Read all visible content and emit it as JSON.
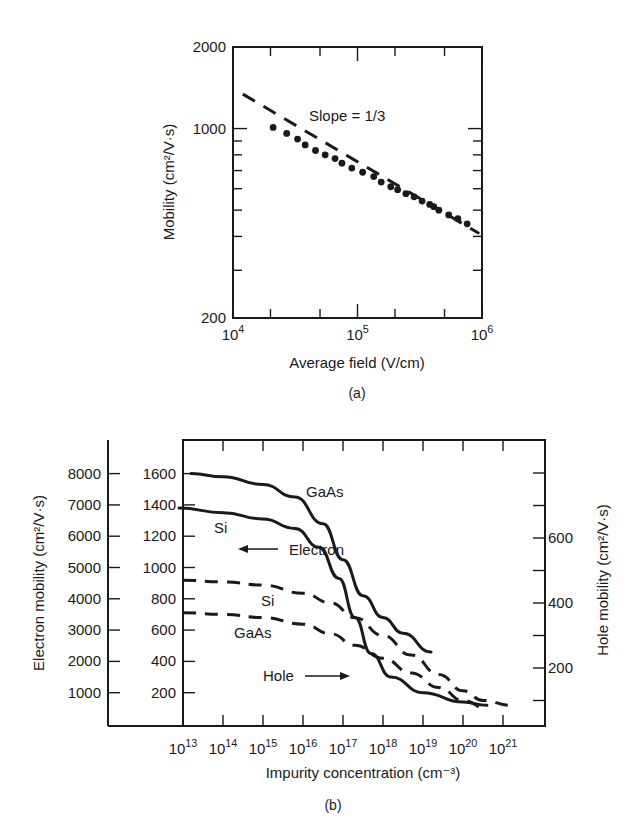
{
  "figure": {
    "panel_a_caption": "(a)",
    "panel_b_caption": "(b)"
  },
  "chart_data": [
    {
      "type": "scatter",
      "panel": "(a)",
      "title": "",
      "xlabel": "Average field (V/cm)",
      "ylabel": "Mobility (cm²/V·s)",
      "xscale": "log",
      "yscale": "log",
      "xlim": [
        10000,
        1000000
      ],
      "ylim": [
        200,
        2000
      ],
      "x_ticks": [
        {
          "value": 10000,
          "base": "10",
          "exp": "4"
        },
        {
          "value": 100000,
          "base": "10",
          "exp": "5"
        },
        {
          "value": 1000000,
          "base": "10",
          "exp": "6"
        }
      ],
      "y_ticks": [
        "200",
        "1000",
        "2000"
      ],
      "annotation": "Slope = 1/3",
      "grid": false,
      "series": [
        {
          "name": "Measured",
          "style": "dots",
          "x": [
            21000,
            27000,
            33000,
            38000,
            46000,
            55000,
            66000,
            75000,
            90000,
            110000,
            135000,
            155000,
            185000,
            210000,
            245000,
            285000,
            330000,
            380000,
            410000,
            450000,
            540000,
            640000,
            760000
          ],
          "y": [
            1010,
            960,
            915,
            870,
            830,
            800,
            775,
            745,
            715,
            690,
            665,
            635,
            610,
            595,
            575,
            560,
            540,
            525,
            515,
            500,
            480,
            465,
            445
          ]
        },
        {
          "name": "Slope = 1/3 fit",
          "style": "dashed",
          "x": [
            12000,
            950000
          ],
          "y": [
            1340,
            410
          ]
        }
      ]
    },
    {
      "type": "line",
      "panel": "(b)",
      "title": "",
      "xlabel": "Impurity concentration (cm⁻³)",
      "ylabel_left_outer": "Electron mobility (cm²/V·s)",
      "ylabel_right": "Hole mobility (cm²/V·s)",
      "xscale": "log",
      "xlim": [
        10000000000000.0,
        1e+21
      ],
      "x_ticks": [
        {
          "base": "10",
          "exp": "13"
        },
        {
          "base": "10",
          "exp": "14"
        },
        {
          "base": "10",
          "exp": "15"
        },
        {
          "base": "10",
          "exp": "16"
        },
        {
          "base": "10",
          "exp": "17"
        },
        {
          "base": "10",
          "exp": "18"
        },
        {
          "base": "10",
          "exp": "19"
        },
        {
          "base": "10",
          "exp": "20"
        },
        {
          "base": "10",
          "exp": "21"
        }
      ],
      "electron_axis_outer_ticks": [
        "8000",
        "7000",
        "6000",
        "5000",
        "4000",
        "3000",
        "2000",
        "1000"
      ],
      "electron_axis_inner_ticks": [
        "1600",
        "1400",
        "1200",
        "1000",
        "800",
        "600",
        "400",
        "200"
      ],
      "hole_axis_ticks": [
        "600",
        "400",
        "200"
      ],
      "annotations": {
        "gaas_electron": "GaAs",
        "si_electron": "Si",
        "electron_arrow": "Electron",
        "si_hole": "Si",
        "gaas_hole": "GaAs",
        "hole_arrow": "Hole"
      },
      "grid": false,
      "series": [
        {
          "name": "GaAs electron",
          "axis": "electron-inner",
          "style": "solid",
          "log10_x": [
            13.2,
            14,
            15,
            15.8,
            16.5,
            17,
            17.5,
            18,
            18.5,
            19.2
          ],
          "y": [
            1600,
            1580,
            1530,
            1450,
            1280,
            1050,
            820,
            680,
            580,
            460
          ]
        },
        {
          "name": "Si electron",
          "axis": "electron-inner",
          "style": "solid",
          "log10_x": [
            12.9,
            14,
            15,
            15.8,
            16.4,
            16.9,
            17.3,
            17.7,
            18.2,
            19,
            20,
            20.6
          ],
          "y": [
            1380,
            1350,
            1310,
            1250,
            1130,
            930,
            680,
            450,
            300,
            200,
            140,
            120
          ]
        },
        {
          "name": "Si hole",
          "axis": "hole",
          "style": "dashed",
          "log10_x": [
            13,
            14,
            15,
            16,
            16.7,
            17.3,
            18,
            18.7,
            19.4,
            20,
            20.5,
            21.2
          ],
          "y": [
            470,
            465,
            455,
            430,
            400,
            355,
            300,
            240,
            180,
            130,
            100,
            85
          ]
        },
        {
          "name": "GaAs hole",
          "axis": "hole",
          "style": "dashed",
          "log10_x": [
            13,
            14,
            15,
            16,
            16.7,
            17.3,
            18,
            18.7,
            19.4,
            20,
            20.6
          ],
          "y": [
            370,
            365,
            355,
            335,
            305,
            270,
            230,
            185,
            140,
            100,
            75
          ]
        }
      ]
    }
  ]
}
